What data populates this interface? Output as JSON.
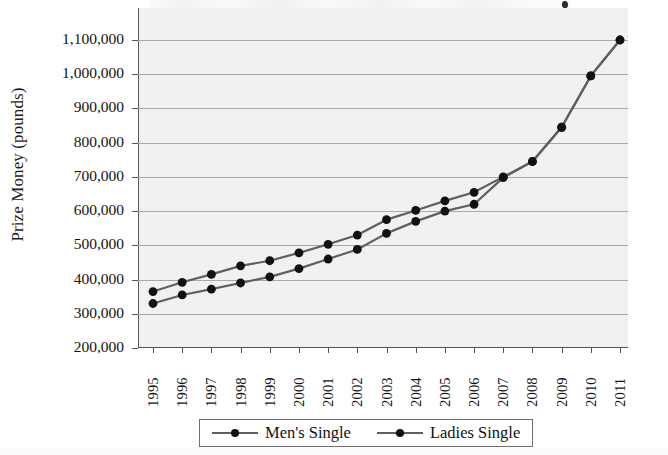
{
  "chart_data": {
    "type": "line",
    "title": "",
    "xlabel": "",
    "ylabel": "Prize Money (pounds)",
    "ylim": [
      200000,
      1100000
    ],
    "ytick_step": 100000,
    "grid": true,
    "legend_position": "bottom",
    "categories": [
      "1995",
      "1996",
      "1997",
      "1998",
      "1999",
      "2000",
      "2001",
      "2002",
      "2003",
      "2004",
      "2005",
      "2006",
      "2007",
      "2008",
      "2009",
      "2010",
      "2011"
    ],
    "ytick_labels": [
      "1,100,000",
      "1,000,000",
      "900,000",
      "800,000",
      "700,000",
      "600,000",
      "500,000",
      "400,000",
      "300,000",
      "200,000"
    ],
    "ytick_values": [
      1100000,
      1000000,
      900000,
      800000,
      700000,
      600000,
      500000,
      400000,
      300000,
      200000
    ],
    "series": [
      {
        "name": "Men's Single",
        "color": "#5f5f5f",
        "marker_color": "#111111",
        "values": [
          365000,
          392000,
          415000,
          440000,
          455000,
          478000,
          503000,
          530000,
          575000,
          602000,
          630000,
          655000,
          700000,
          745000,
          845000,
          995000,
          1100000
        ]
      },
      {
        "name": "Ladies Single",
        "color": "#5f5f5f",
        "marker_color": "#111111",
        "values": [
          330000,
          355000,
          372000,
          390000,
          408000,
          432000,
          460000,
          488000,
          535000,
          570000,
          600000,
          620000,
          698000,
          745000,
          845000,
          995000,
          1100000
        ]
      }
    ]
  },
  "legend": {
    "items": [
      {
        "label": "Men's Single"
      },
      {
        "label": "Ladies Single"
      }
    ]
  }
}
